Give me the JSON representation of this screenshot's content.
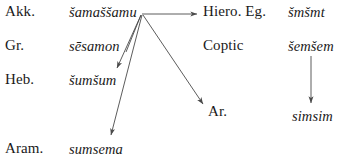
{
  "diagram": {
    "type": "etymology-tree",
    "line_color": "#4a4a4a",
    "text_color": "#1a1a1a",
    "background": "#ffffff",
    "nodes": [
      {
        "id": "akk",
        "language": "Akk.",
        "form": "šamaššamu"
      },
      {
        "id": "gr",
        "language": "Gr.",
        "form": "sēsamon"
      },
      {
        "id": "heb",
        "language": "Heb.",
        "form": "šumšum"
      },
      {
        "id": "aram",
        "language": "Aram.",
        "form": "sumsema"
      },
      {
        "id": "hiero",
        "language": "Hiero. Eg.",
        "form": "šmšmt"
      },
      {
        "id": "coptic",
        "language": "Coptic",
        "form": "šemšem"
      },
      {
        "id": "ar",
        "language": "Ar.",
        "form": "simsim"
      }
    ],
    "edges": [
      {
        "from": "akk",
        "to": "hiero",
        "shape": "horizontal-right"
      },
      {
        "from": "akk",
        "to": "gr",
        "shape": "diagonal-down-left"
      },
      {
        "from": "akk",
        "to": "heb",
        "shape": "diagonal-down-left"
      },
      {
        "from": "akk",
        "to": "aram",
        "shape": "long-diagonal-down-left"
      },
      {
        "from": "akk",
        "to": "ar",
        "shape": "diagonal-down-right"
      },
      {
        "from": "coptic",
        "to": "simsim",
        "shape": "vertical-down"
      }
    ]
  }
}
